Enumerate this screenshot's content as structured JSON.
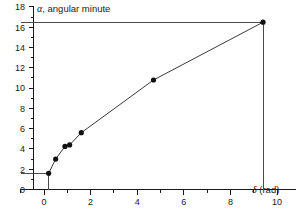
{
  "chart_data": {
    "type": "line",
    "title": "",
    "ylabel": "α, angular minute",
    "xlabel": "δ (rad)",
    "xlim": [
      -1.0,
      11.0
    ],
    "ylim": [
      0,
      18
    ],
    "xticks": [
      0,
      2,
      4,
      6,
      8,
      10
    ],
    "yticks": [
      0,
      2,
      4,
      6,
      8,
      10,
      12,
      14,
      16,
      18
    ],
    "xtick_labels": [
      "0",
      "2",
      "4",
      "6",
      "8",
      "10"
    ],
    "ytick_labels": [
      "0",
      "2",
      "4",
      "6",
      "8",
      "10",
      "12",
      "14",
      "16",
      "18"
    ],
    "grid": false,
    "legend": null,
    "minor_ticks": true,
    "x": [
      0.2,
      0.5,
      0.9,
      1.1,
      1.6,
      4.7,
      9.4
    ],
    "y": [
      1.6,
      3.0,
      4.25,
      4.4,
      5.6,
      10.8,
      16.5
    ],
    "series": [
      {
        "name": "alpha vs delta",
        "marker": "filled-circle",
        "values": [
          1.6,
          3.0,
          4.25,
          4.4,
          5.6,
          10.8,
          16.5
        ]
      }
    ],
    "annotations": {
      "guide_lines": [
        {
          "name": "first-point-horizontal-guide",
          "from": [
            -1.0,
            1.6
          ],
          "to": [
            0.2,
            1.6
          ]
        },
        {
          "name": "first-point-vertical-guide",
          "from": [
            0.2,
            1.6
          ],
          "to": [
            0.2,
            0
          ]
        },
        {
          "name": "last-point-horizontal-guide",
          "from": [
            -1.0,
            16.5
          ],
          "to": [
            9.4,
            16.5
          ]
        },
        {
          "name": "last-point-vertical-guide",
          "from": [
            9.4,
            16.5
          ],
          "to": [
            9.4,
            0
          ]
        }
      ]
    }
  },
  "labels": {
    "y_axis_greek": "α",
    "y_axis_rest": ", angular minute",
    "x_axis_greek": "δ",
    "x_axis_rest": " (rad)"
  }
}
